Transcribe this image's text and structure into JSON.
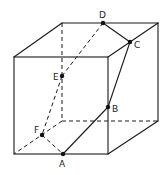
{
  "diagram": {
    "type": "cube-cross-section",
    "stroke_color": "#1a1a1a",
    "background": "#ffffff",
    "cube": {
      "front_face": {
        "tl": [
          14,
          57
        ],
        "tr": [
          108,
          57
        ],
        "bl": [
          14,
          154
        ],
        "br": [
          108,
          154
        ]
      },
      "back_face": {
        "tl": [
          62,
          23
        ],
        "tr": [
          158,
          23
        ],
        "bl": [
          62,
          121
        ],
        "br": [
          158,
          121
        ]
      },
      "hidden_edges": [
        "back-top-left to back-bottom-left",
        "back-bottom-left to back-bottom-right",
        "back-bottom-left to front-bottom-left"
      ]
    },
    "points": [
      {
        "label": "A",
        "x": 63,
        "y": 154,
        "lx": 58,
        "ly": 167
      },
      {
        "label": "B",
        "x": 108,
        "y": 107,
        "lx": 113,
        "ly": 112
      },
      {
        "label": "C",
        "x": 130,
        "y": 42,
        "lx": 135,
        "ly": 48
      },
      {
        "label": "D",
        "x": 103,
        "y": 23,
        "lx": 99,
        "ly": 18
      },
      {
        "label": "E",
        "x": 62,
        "y": 76,
        "lx": 53,
        "ly": 80
      },
      {
        "label": "F",
        "x": 42,
        "y": 135,
        "lx": 34,
        "ly": 133
      }
    ],
    "section_edges": [
      {
        "from": "A",
        "to": "B",
        "style": "solid"
      },
      {
        "from": "B",
        "to": "C",
        "style": "solid"
      },
      {
        "from": "C",
        "to": "D",
        "style": "solid"
      },
      {
        "from": "D",
        "to": "E",
        "style": "dashed"
      },
      {
        "from": "E",
        "to": "F",
        "style": "dashed"
      },
      {
        "from": "F",
        "to": "A",
        "style": "dashed"
      }
    ]
  },
  "labels": {
    "A": "A",
    "B": "B",
    "C": "C",
    "D": "D",
    "E": "E",
    "F": "F"
  }
}
